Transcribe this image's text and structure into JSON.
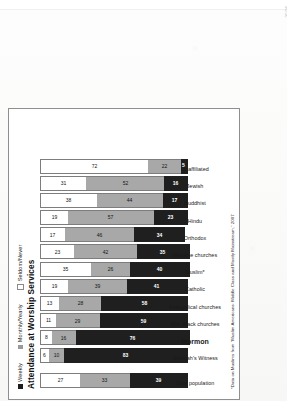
{
  "page": {
    "page_number": "20/26",
    "edge_marks": "· · · · · · · · ·"
  },
  "figure": {
    "title": "Attendance at Worship Services",
    "footnote": "*Data on Muslims from “Muslim Americans: Middle Class and Mostly Mainstream,” 2007",
    "legend": [
      {
        "label": "Weekly",
        "color": "#1f1f1f",
        "swatch": "sw-weekly"
      },
      {
        "label": "Monthly/Yearly",
        "color": "#a8a8a8",
        "swatch": "sw-monthly"
      },
      {
        "label": "Seldom/Never",
        "color": "#ffffff",
        "swatch": "sw-seldom"
      }
    ]
  },
  "chart_data": {
    "type": "bar",
    "orientation": "horizontal-stacked",
    "title": "Attendance at Worship Services",
    "xlabel": "",
    "ylabel": "",
    "ylim": [
      0,
      100
    ],
    "grid": false,
    "legend_position": "top-left",
    "categories": [
      "Total population",
      "Jehovah's Witness",
      "Mormon",
      "Hist. black churches",
      "Evangelical churches",
      "Catholic",
      "Muslim*",
      "Mainline churches",
      "Orthodox",
      "Hindu",
      "Buddhist",
      "Jewish",
      "Unaffiliated"
    ],
    "emphasized_category": "Mormon",
    "separator_after_index": 0,
    "series": [
      {
        "name": "Weekly",
        "color": "#1f1f1f",
        "values": [
          39,
          83,
          76,
          59,
          58,
          41,
          40,
          35,
          34,
          23,
          17,
          16,
          5
        ]
      },
      {
        "name": "Monthly/Yearly",
        "color": "#a8a8a8",
        "values": [
          33,
          10,
          16,
          29,
          28,
          39,
          26,
          42,
          46,
          57,
          44,
          52,
          22
        ]
      },
      {
        "name": "Seldom/Never",
        "color": "#ffffff",
        "values": [
          27,
          6,
          8,
          11,
          13,
          19,
          35,
          23,
          17,
          19,
          38,
          31,
          72
        ]
      }
    ],
    "note": "values are percentages"
  }
}
